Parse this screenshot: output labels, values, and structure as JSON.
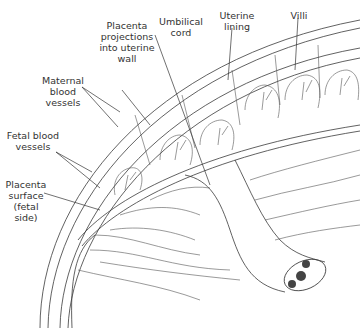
{
  "diagram": {
    "labels": [
      {
        "id": "placenta-projections",
        "text": "Placenta\nprojections\ninto uterine\nwall"
      },
      {
        "id": "umbilical-cord",
        "text": "Umbilical\ncord"
      },
      {
        "id": "uterine-lining",
        "text": "Uterine\nlining"
      },
      {
        "id": "villi",
        "text": "Villi"
      },
      {
        "id": "maternal-blood-vessels",
        "text": "Maternal\nblood\nvessels"
      },
      {
        "id": "fetal-blood-vessels",
        "text": "Fetal blood\nvessels"
      },
      {
        "id": "placenta-surface",
        "text": "Placenta\nsurface\n(fetal\nside)"
      }
    ],
    "colors": {
      "ink": "#3a3a3a",
      "background": "#ffffff",
      "vessel_fill": "#444444"
    }
  }
}
